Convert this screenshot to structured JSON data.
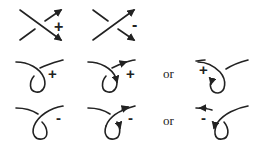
{
  "diagram": {
    "stroke_color": "#222222",
    "background": "#ffffff",
    "row1": {
      "items": [
        {
          "type": "crossing",
          "sign": "+",
          "label": "+"
        },
        {
          "type": "crossing",
          "sign": "-",
          "label": "-"
        }
      ]
    },
    "row2": {
      "items": [
        {
          "type": "kink-unoriented",
          "label": "+"
        },
        {
          "type": "kink-oriented-right",
          "label": "+"
        },
        {
          "type": "kink-oriented-left",
          "label": "+"
        }
      ],
      "connector": "or"
    },
    "row3": {
      "items": [
        {
          "type": "kink-unoriented",
          "label": "-"
        },
        {
          "type": "kink-oriented-right",
          "label": "-"
        },
        {
          "type": "kink-oriented-left",
          "label": "-"
        }
      ],
      "connector": "or"
    }
  }
}
